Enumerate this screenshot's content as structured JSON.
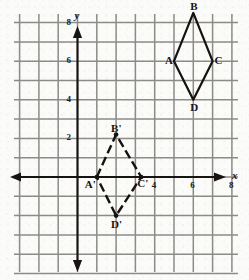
{
  "figure": {
    "background_color": "#fbfbf9",
    "grid_color": "#8d8b86",
    "axis_color": "#171412",
    "shape_color": "#15120f"
  },
  "axes": {
    "x_label": "x",
    "y_label": "y",
    "x_ticks": [
      "4",
      "6",
      "8"
    ],
    "y_ticks": [
      "8",
      "6",
      "4",
      "2"
    ],
    "x_tick_values": [
      4,
      6,
      8
    ],
    "y_tick_values": [
      8,
      6,
      4,
      2
    ],
    "grid_spacing_units": 1,
    "x_range": [
      -4,
      9.5
    ],
    "y_range": [
      -5,
      9.5
    ],
    "arrowheads": [
      "left",
      "right",
      "up",
      "down"
    ]
  },
  "shapes": [
    {
      "name": "rhombus-abcd",
      "style": "solid",
      "vertices": [
        {
          "label": "A",
          "x": 5,
          "y": 6,
          "label_position": "left"
        },
        {
          "label": "B",
          "x": 6,
          "y": 8.5,
          "label_position": "above"
        },
        {
          "label": "C",
          "x": 7,
          "y": 6,
          "label_position": "right"
        },
        {
          "label": "D",
          "x": 6,
          "y": 4,
          "label_position": "below"
        }
      ]
    },
    {
      "name": "rhombus-a-prime-b-prime-c-prime-d-prime",
      "style": "dashed",
      "vertices": [
        {
          "label": "A'",
          "x": 1,
          "y": 0,
          "label_position": "below-left"
        },
        {
          "label": "B'",
          "x": 2,
          "y": 2.2,
          "label_position": "above"
        },
        {
          "label": "C'",
          "x": 3.3,
          "y": 0,
          "label_position": "below-right"
        },
        {
          "label": "D'",
          "x": 2,
          "y": -2,
          "label_position": "below"
        }
      ]
    }
  ],
  "labels": {
    "a": "A",
    "b": "B",
    "c": "C",
    "d": "D",
    "a_prime": "A'",
    "b_prime": "B'",
    "c_prime": "C'",
    "d_prime": "D'",
    "tick_x_4": "4",
    "tick_x_6": "6",
    "tick_x_8": "8",
    "tick_y_8": "8",
    "tick_y_6": "6",
    "tick_y_4": "4",
    "tick_y_2": "2",
    "axis_x": "x",
    "axis_y": "y"
  }
}
